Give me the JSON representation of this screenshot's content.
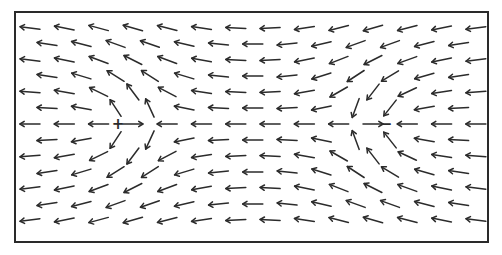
{
  "diagram": {
    "type": "vector-field",
    "frame": {
      "x": 15,
      "y": 12,
      "width": 473,
      "height": 230,
      "stroke": "#2a2a2a"
    },
    "grid": {
      "rows": 13,
      "row_y_start": 28,
      "row_spacing": 16,
      "col_x_start": 30,
      "col_spacing": 34.3,
      "even_row_cols": 14,
      "odd_row_cols": 13,
      "odd_row_offset": 17
    },
    "uniform_flow": {
      "u": -1.0,
      "v": 0.0
    },
    "markers": [
      {
        "label": "+",
        "kind": "source",
        "x": 118,
        "y": 124,
        "strength": 1800
      },
      {
        "label": "−",
        "kind": "sink",
        "x": 386,
        "y": 124,
        "strength": -1800
      }
    ],
    "arrow_length": 20,
    "head_size": 5,
    "exclusion_radius": 10,
    "color": "#2b2b2b"
  }
}
